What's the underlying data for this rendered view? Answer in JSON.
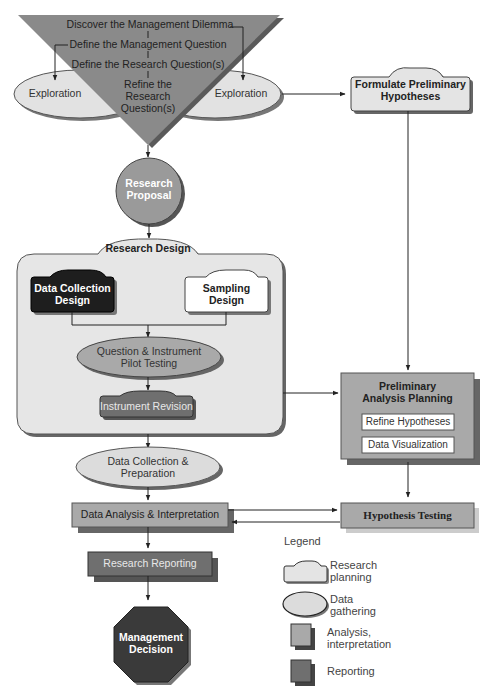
{
  "funnel": {
    "steps": [
      "Discover the Management Dilemma",
      "Define the Management Question",
      "Define the Research Question(s)",
      "Refine the\nResearch\nQuestion(s)"
    ],
    "step4_lines": [
      "Refine the",
      "Research",
      "Question(s)"
    ]
  },
  "exploration_left": "Exploration",
  "exploration_right": "Exploration",
  "formulate": {
    "line1": "Formulate Preliminary",
    "line2": "Hypotheses"
  },
  "proposal": {
    "line1": "Research",
    "line2": "Proposal"
  },
  "research_design": {
    "title": "Research Design",
    "data_collection": {
      "line1": "Data Collection",
      "line2": "Design"
    },
    "sampling": {
      "line1": "Sampling",
      "line2": "Design"
    },
    "pilot": {
      "line1": "Question & Instrument",
      "line2": "Pilot Testing"
    },
    "revision": "Instrument Revision"
  },
  "preliminary": {
    "line1": "Preliminary",
    "line2": "Analysis Planning",
    "items": [
      "Refine Hypotheses",
      "Data Visualization"
    ]
  },
  "data_collection_prep": {
    "line1": "Data Collection &",
    "line2": "Preparation"
  },
  "data_analysis": "Data Analysis & Interpretation",
  "hypothesis_testing": "Hypothesis Testing",
  "reporting": "Research Reporting",
  "decision": {
    "line1": "Management",
    "line2": "Decision"
  },
  "legend": {
    "title": "Legend",
    "items": [
      {
        "shape": "research-planning-shape",
        "line1": "Research",
        "line2": "planning"
      },
      {
        "shape": "data-gathering-shape",
        "line1": "Data",
        "line2": "gathering"
      },
      {
        "shape": "analysis-shape",
        "line1": "Analysis,",
        "line2": "interpretation"
      },
      {
        "shape": "reporting-shape",
        "line1": "Reporting",
        "line2": ""
      }
    ]
  },
  "colors": {
    "funnel": "#8a8a8a",
    "planning_fill": "#e4e4e4",
    "gathering_fill": "#d9d9d9",
    "analysis_fill": "#a9a9a9",
    "reporting_fill": "#6f6f6f",
    "dark": "#1e1e1e",
    "proposal": "#9a9a9a",
    "decision": "#3a3a3a"
  }
}
